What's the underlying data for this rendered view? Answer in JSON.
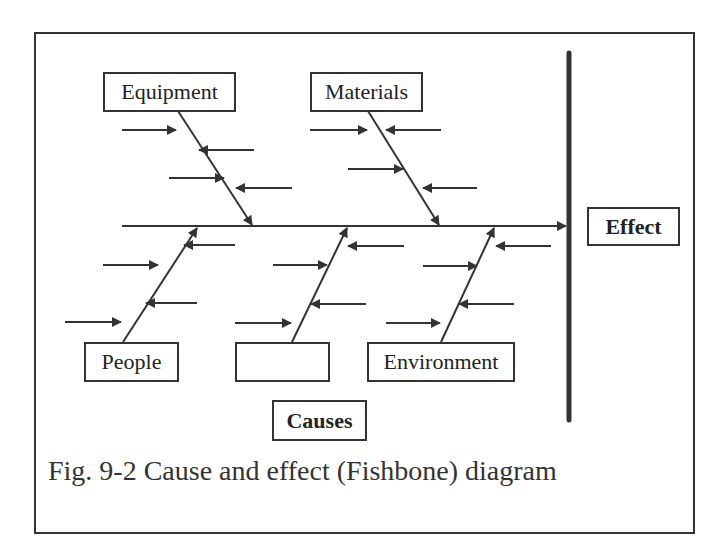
{
  "diagram": {
    "type": "fishbone",
    "effect_label": "Effect",
    "causes_label": "Causes",
    "categories": [
      {
        "label": "Equipment",
        "position": "top",
        "contributing_arrows": 4
      },
      {
        "label": "Materials",
        "position": "top",
        "contributing_arrows": 4
      },
      {
        "label": "People",
        "position": "bottom",
        "contributing_arrows": 4
      },
      {
        "label": "",
        "position": "bottom",
        "contributing_arrows": 4
      },
      {
        "label": "Environment",
        "position": "bottom",
        "contributing_arrows": 4
      }
    ],
    "caption": "Fig. 9-2 Cause and effect (Fishbone) diagram"
  },
  "colors": {
    "line": "#333333",
    "background": "#ffffff"
  }
}
